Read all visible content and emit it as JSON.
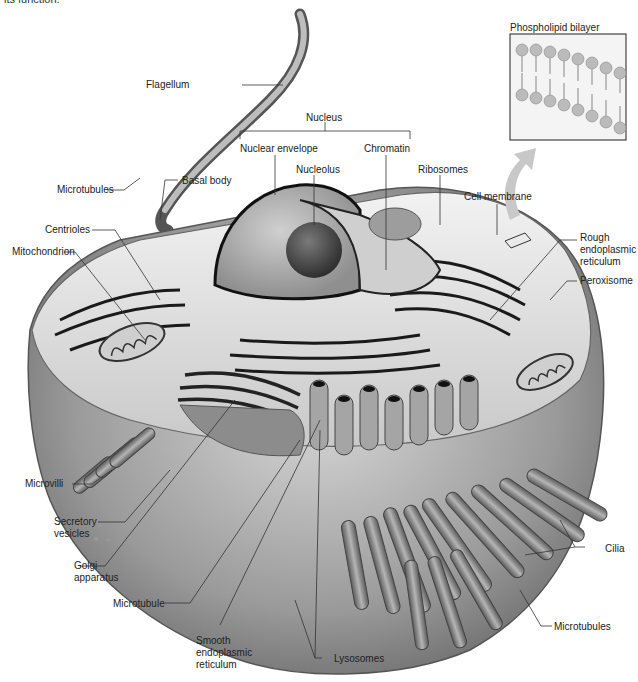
{
  "caption_fragment": "its function.",
  "inset": {
    "title": "Phospholipid bilayer"
  },
  "labels": {
    "flagellum": "Flagellum",
    "nucleus": "Nucleus",
    "nuclear_envelope": "Nuclear envelope",
    "chromatin": "Chromatin",
    "nucleolus": "Nucleolus",
    "ribosomes": "Ribosomes",
    "cell_membrane": "Cell membrane",
    "microtubules_top": "Microtubules",
    "basal_body": "Basal body",
    "centrioles": "Centrioles",
    "mitochondrion": "Mitochondrion",
    "rough_er": "Rough endoplasmic reticulum",
    "peroxisome": "Peroxisome",
    "microvilli": "Microvilli",
    "secretory_vesicles": "Secretory vesicles",
    "golgi_apparatus": "Golgi apparatus",
    "microtubule": "Microtubule",
    "smooth_er": "Smooth endoplasmic reticulum",
    "lysosomes": "Lysosomes",
    "cilia": "Cilia",
    "microtubules_bottom": "Microtubules"
  },
  "colors": {
    "label_text": "#222222",
    "leader_line": "#333333",
    "cell_shade": "#8a8a8a",
    "arrow": "#c8c8c8"
  }
}
